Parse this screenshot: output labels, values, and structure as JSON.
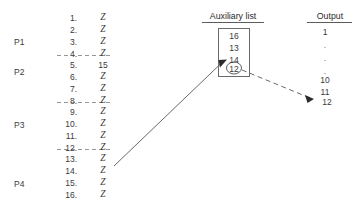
{
  "figure": {
    "kind": "external-sort-merge-diagram",
    "background": "#ffffff",
    "ink": "#3a3a3a"
  },
  "partitions": [
    {
      "label": "P1"
    },
    {
      "label": "P2"
    },
    {
      "label": "P3"
    },
    {
      "label": "P4"
    }
  ],
  "input_list": {
    "rows": [
      {
        "num": "1.",
        "value": "Z"
      },
      {
        "num": "2.",
        "value": "Z"
      },
      {
        "num": "3.",
        "value": "Z"
      },
      {
        "num": "4.",
        "value": "Z"
      },
      {
        "num": "5.",
        "value": "15"
      },
      {
        "num": "6.",
        "value": "Z"
      },
      {
        "num": "7.",
        "value": "Z"
      },
      {
        "num": "8.",
        "value": "Z"
      },
      {
        "num": "9.",
        "value": "Z"
      },
      {
        "num": "10.",
        "value": "Z"
      },
      {
        "num": "11.",
        "value": "Z"
      },
      {
        "num": "12.",
        "value": "Z"
      },
      {
        "num": "13.",
        "value": "Z"
      },
      {
        "num": "14.",
        "value": "Z"
      },
      {
        "num": "15.",
        "value": "Z"
      },
      {
        "num": "16.",
        "value": "Z"
      }
    ]
  },
  "auxiliary": {
    "title": "Auxiliary list",
    "items": [
      {
        "value": "16",
        "highlighted": false
      },
      {
        "value": "13",
        "highlighted": false
      },
      {
        "value": "14",
        "highlighted": false
      },
      {
        "value": "12",
        "highlighted": true
      }
    ]
  },
  "output": {
    "title": "Output",
    "items": [
      {
        "value": "1"
      },
      {
        "value": "."
      },
      {
        "value": "."
      },
      {
        "value": "."
      },
      {
        "value": "."
      },
      {
        "value": "10"
      },
      {
        "value": "11"
      },
      {
        "value": "12"
      }
    ]
  }
}
